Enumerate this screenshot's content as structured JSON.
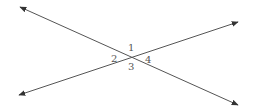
{
  "diagram": {
    "line_color": "#555555",
    "lines": [
      {
        "name": "line-a",
        "from": [
          20,
          7
        ],
        "to": [
          238,
          105
        ],
        "arrows": "both"
      },
      {
        "name": "line-b",
        "from": [
          19,
          95
        ],
        "to": [
          238,
          22
        ],
        "arrows": "both"
      }
    ],
    "intersection": [
      130,
      57
    ],
    "angle_labels": [
      {
        "id": "angle-1",
        "text": "1",
        "x": 128,
        "y": 51
      },
      {
        "id": "angle-2",
        "text": "2",
        "x": 111,
        "y": 62
      },
      {
        "id": "angle-3",
        "text": "3",
        "x": 128,
        "y": 70
      },
      {
        "id": "angle-4",
        "text": "4",
        "x": 145,
        "y": 63
      }
    ]
  }
}
